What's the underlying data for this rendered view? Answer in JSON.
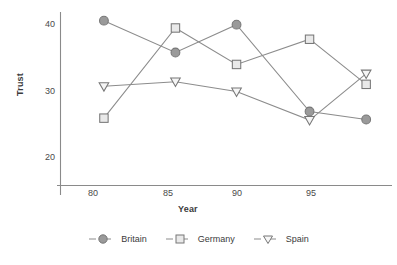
{
  "chart_data": {
    "type": "line",
    "title": "",
    "xlabel": "Year",
    "ylabel": "Trust",
    "x": [
      80.7,
      85.5,
      89.6,
      94.5,
      98.3
    ],
    "xticks": [
      80,
      85,
      90,
      95
    ],
    "yticks": [
      20,
      30,
      40
    ],
    "xlim": [
      78.5,
      99.5
    ],
    "ylim": [
      16.5,
      41.5
    ],
    "grid": false,
    "legend_position": "bottom",
    "series": [
      {
        "name": "Britain",
        "marker": "circle",
        "color": "#8c8c8c",
        "fill": "#9a9a9a",
        "values": [
          40.5,
          35.7,
          39.9,
          26.8,
          25.6
        ]
      },
      {
        "name": "Germany",
        "marker": "square",
        "color": "#8c8c8c",
        "fill": "#e9e9e9",
        "values": [
          25.8,
          39.4,
          33.9,
          37.7,
          30.9
        ]
      },
      {
        "name": "Spain",
        "marker": "triangle-down",
        "color": "#8c8c8c",
        "fill": "#f5f5f5",
        "values": [
          30.6,
          31.3,
          29.8,
          25.5,
          32.5
        ]
      }
    ]
  },
  "axes": {
    "ylabel": "Trust",
    "xlabel": "Year",
    "ytick_labels": [
      "40",
      "30",
      "20"
    ],
    "xtick_labels": [
      "80",
      "85",
      "90",
      "95"
    ]
  },
  "legend": {
    "items": [
      {
        "label": "Britain",
        "marker": "circle-marker"
      },
      {
        "label": "Germany",
        "marker": "square-marker"
      },
      {
        "label": "Spain",
        "marker": "triangle-down-marker"
      }
    ]
  },
  "colors": {
    "line": "#8c8c8c",
    "axis": "#7a7a7a",
    "text": "#3b3b3b"
  }
}
